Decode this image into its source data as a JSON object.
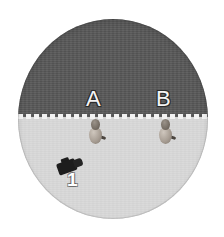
{
  "scene": {
    "title": "overhead-arena-view",
    "background_color": "#ffffff"
  },
  "arena": {
    "shape": "circle",
    "rim_color": "#b9b9b9",
    "top_half": {
      "name": "dark-zone",
      "color": "#575757"
    },
    "bottom_half": {
      "name": "light-zone",
      "color": "#d9d9d9"
    },
    "divider": {
      "style": "dashed",
      "color": "#f2f2f2"
    }
  },
  "labels": {
    "zone_a": "A",
    "zone_b": "B",
    "camera": "1"
  },
  "subjects": [
    {
      "id": "subject-a",
      "at_label": "A"
    },
    {
      "id": "subject-b",
      "at_label": "B"
    }
  ],
  "camera": {
    "id": "camera-1",
    "label": "1",
    "color": "#1d1d1d"
  }
}
